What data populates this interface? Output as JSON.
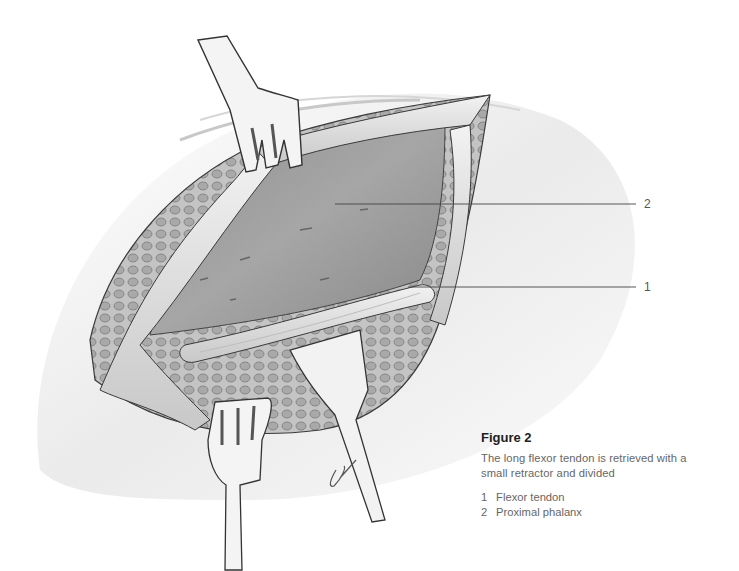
{
  "figure": {
    "title": "Figure 2",
    "caption": "The long flexor tendon is retrieved with a small retractor and divided",
    "caption_line1": "The long flexor tendon is retrieved with a",
    "caption_line2": "small retractor and divided",
    "legend": [
      {
        "number": "1",
        "label": "Flexor tendon"
      },
      {
        "number": "2",
        "label": "Proximal phalanx"
      }
    ]
  },
  "callouts": [
    {
      "number": "2",
      "target": "Proximal phalanx",
      "line": {
        "x1": 335,
        "y1": 204,
        "x2": 636,
        "y2": 204
      }
    },
    {
      "number": "1",
      "target": "Flexor tendon",
      "line": {
        "x1": 408,
        "y1": 287,
        "x2": 636,
        "y2": 287
      }
    }
  ],
  "illustration": {
    "subject": "surgical wound with two fork retractors and one flat retractor",
    "colors": {
      "skin": "#efefef",
      "bone": "#9a9a9a",
      "tendon": "#e6e6e6",
      "fat": "#b8b8b8",
      "outline": "#3a3a3a"
    },
    "signature": "artist signature"
  }
}
